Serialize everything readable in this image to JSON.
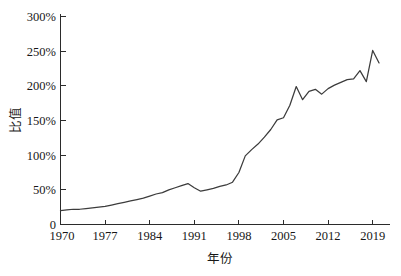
{
  "chart_data": {
    "type": "line",
    "title": "",
    "subtitle": "",
    "xlabel": "年份",
    "ylabel": "比值",
    "xlim": [
      1970,
      2020
    ],
    "ylim": [
      0,
      300
    ],
    "grid": false,
    "legend": false,
    "legend_position": "none",
    "x_tick_labels": [
      "1970",
      "1977",
      "1984",
      "1991",
      "1998",
      "2005",
      "2012",
      "2019"
    ],
    "x_tick_values": [
      1970,
      1977,
      1984,
      1991,
      1998,
      2005,
      2012,
      2019
    ],
    "y_tick_labels": [
      "0",
      "50%",
      "100%",
      "150%",
      "200%",
      "250%",
      "300%"
    ],
    "y_tick_values": [
      0,
      50,
      100,
      150,
      200,
      250,
      300
    ],
    "y_unit": "%",
    "series": [
      {
        "name": "比值",
        "color": "#3c3c3c",
        "x": [
          1970,
          1971,
          1972,
          1973,
          1974,
          1975,
          1976,
          1977,
          1978,
          1979,
          1980,
          1981,
          1982,
          1983,
          1984,
          1985,
          1986,
          1987,
          1988,
          1989,
          1990,
          1991,
          1992,
          1993,
          1994,
          1995,
          1996,
          1997,
          1998,
          1999,
          2000,
          2001,
          2002,
          2003,
          2004,
          2005,
          2006,
          2007,
          2008,
          2009,
          2010,
          2011,
          2012,
          2013,
          2014,
          2015,
          2016,
          2017,
          2018,
          2019,
          2020
        ],
        "values": [
          20,
          21,
          22,
          22,
          23,
          24,
          25,
          26,
          28,
          30,
          32,
          34,
          36,
          38,
          41,
          44,
          46,
          50,
          53,
          56,
          59,
          53,
          48,
          50,
          52,
          55,
          57,
          61,
          75,
          99,
          108,
          116,
          126,
          137,
          151,
          154,
          172,
          199,
          180,
          192,
          195,
          188,
          196,
          201,
          205,
          209,
          210,
          222,
          206,
          251,
          233
        ]
      }
    ]
  }
}
